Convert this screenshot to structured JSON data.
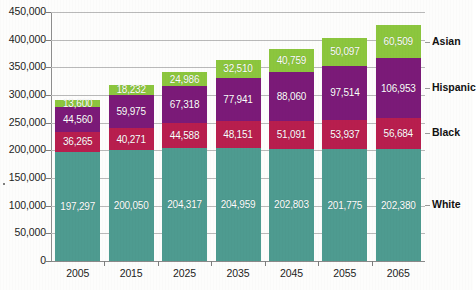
{
  "chart_data": {
    "type": "bar",
    "subtype": "stacked-vertical",
    "title": "",
    "subtitle": "",
    "xlabel": "",
    "ylabel": "",
    "categories": [
      "2005",
      "2015",
      "2025",
      "2035",
      "2045",
      "2055",
      "2065"
    ],
    "series": [
      {
        "name": "White",
        "color": "#4E9B90",
        "label_color": "#ffffff",
        "values": [
          197297,
          200050,
          204317,
          204959,
          202803,
          201775,
          202380
        ],
        "value_labels": [
          "197,297",
          "200,050",
          "204,317",
          "204,959",
          "202,803",
          "201,775",
          "202,380"
        ]
      },
      {
        "name": "Black",
        "color": "#B81E4E",
        "label_color": "#ffffff",
        "values": [
          36265,
          40271,
          44588,
          48151,
          51091,
          53937,
          56684
        ],
        "value_labels": [
          "36,265",
          "40,271",
          "44,588",
          "48,151",
          "51,091",
          "53,937",
          "56,684"
        ]
      },
      {
        "name": "Hispanic",
        "color": "#7B1A78",
        "label_color": "#ffffff",
        "values": [
          44560,
          59975,
          67318,
          77941,
          88060,
          97514,
          106953
        ],
        "value_labels": [
          "44,560",
          "59,975",
          "67,318",
          "77,941",
          "88,060",
          "97,514",
          "106,953"
        ]
      },
      {
        "name": "Asian",
        "color": "#8CC63E",
        "label_color": "#ffffff",
        "values": [
          13600,
          18232,
          24986,
          32510,
          40759,
          50097,
          60509
        ],
        "value_labels": [
          "13,600",
          "18,232",
          "24,986",
          "32,510",
          "40,759",
          "50,097",
          "60,509"
        ]
      }
    ],
    "ylim": [
      0,
      450000
    ],
    "ytick_values": [
      0,
      50000,
      100000,
      150000,
      200000,
      250000,
      300000,
      350000,
      400000,
      450000
    ],
    "ytick_labels": [
      "0",
      "50,000",
      "100,000",
      "150,000",
      "200,000",
      "250,000",
      "300,000",
      "350,000",
      "400,000",
      "450,000"
    ],
    "grid": true,
    "grid_axis": "y",
    "legend_position": "right-of-plot-inline",
    "legend_entries": [
      "Asian",
      "Hispanic",
      "Black",
      "White"
    ]
  },
  "colors": {
    "asian": "#8CC63E",
    "hispanic": "#7B1A78",
    "black": "#B81E4E",
    "white": "#4E9B90",
    "gridline": "#b9b9b9",
    "axis": "#8f8f8f",
    "text": "#1d1d1d",
    "background": "#fdfdfc"
  }
}
